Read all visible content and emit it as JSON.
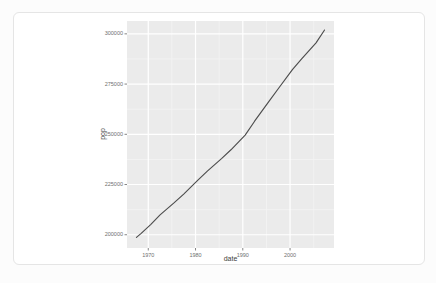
{
  "card": {
    "kind": "plot-output"
  },
  "colors": {
    "page_bg": "#fcfcfc",
    "card_bg": "#ffffff",
    "card_border": "#e5e5e5",
    "panel_bg": "#ebebeb",
    "grid_major": "#ffffff",
    "grid_minor": "#f4f4f4",
    "line": "#4d4d4d",
    "tick_mark": "#666666",
    "tick_label": "#6f6f6f",
    "axis_title": "#3d3d3d"
  },
  "chart_data": {
    "type": "line",
    "title": "",
    "xlabel": "date",
    "ylabel": "pop",
    "legend": "none",
    "grid": "on",
    "x_domain": [
      1965.5,
      2009.3
    ],
    "y_domain": [
      193400,
      306400
    ],
    "x_ticks": [
      {
        "value": 1970,
        "label": "1970"
      },
      {
        "value": 1980,
        "label": "1980"
      },
      {
        "value": 1990,
        "label": "1990"
      },
      {
        "value": 2000,
        "label": "2000"
      }
    ],
    "y_ticks": [
      {
        "value": 200000,
        "label": "200000"
      },
      {
        "value": 225000,
        "label": "225000"
      },
      {
        "value": 250000,
        "label": "250000"
      },
      {
        "value": 275000,
        "label": "275000"
      },
      {
        "value": 300000,
        "label": "300000"
      }
    ],
    "x_minor": [
      1975,
      1985,
      1995,
      2005
    ],
    "y_minor": [
      212500,
      237500,
      262500,
      287500
    ],
    "series": [
      {
        "name": "pop",
        "points": [
          [
            1967.5,
            198712
          ],
          [
            1968.5,
            200706
          ],
          [
            1970.5,
            205052
          ],
          [
            1972.5,
            209896
          ],
          [
            1975.5,
            215973
          ],
          [
            1977.5,
            220239
          ],
          [
            1980.5,
            227225
          ],
          [
            1982.5,
            231664
          ],
          [
            1985.5,
            237924
          ],
          [
            1987.5,
            242289
          ],
          [
            1990.5,
            249623
          ],
          [
            1992.5,
            256514
          ],
          [
            1995.5,
            266278
          ],
          [
            1997.5,
            272657
          ],
          [
            2000.5,
            282162
          ],
          [
            2002.5,
            287625
          ],
          [
            2005.5,
            295516
          ],
          [
            2007.3,
            301913
          ]
        ]
      }
    ]
  }
}
